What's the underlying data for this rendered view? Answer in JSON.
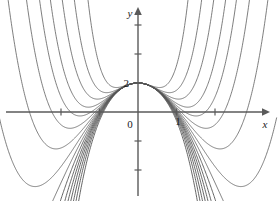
{
  "figure": {
    "title": "",
    "background_color": "#ffffff",
    "curve_color": "#555555",
    "axis_color": "#5a5a5a",
    "text_color": "#1a1a1a"
  },
  "axes": {
    "x_axis_label": "x",
    "y_axis_label": "y",
    "origin_label": "0",
    "x_tick_labels": [
      "1"
    ],
    "y_tick_labels": [
      "2"
    ],
    "x_axis_arrow": "arrow-right",
    "y_axis_arrow": "arrow-up"
  },
  "chart_data": {
    "type": "line",
    "title": "",
    "xlabel": "x",
    "ylabel": "y",
    "grid": false,
    "legend": "none",
    "xlim": [
      -3.4,
      3.4
    ],
    "ylim": [
      -4.6,
      4.4
    ],
    "xticks": [
      -2,
      -1,
      0,
      1,
      2
    ],
    "xtick_labels": [
      "",
      "",
      "0",
      "1",
      ""
    ],
    "yticks": [
      -3,
      -2,
      -1,
      0,
      1,
      2,
      3,
      4
    ],
    "ytick_labels": [
      "",
      "",
      "",
      "0",
      "",
      "2",
      "",
      ""
    ],
    "series": [
      {
        "name": "c=-1.0",
        "direction": "down",
        "steepness": 1.0
      },
      {
        "name": "c=-0.8",
        "direction": "down",
        "steepness": 0.8
      },
      {
        "name": "c=-0.6",
        "direction": "down",
        "steepness": 0.6
      },
      {
        "name": "c=-0.4",
        "direction": "down",
        "steepness": 0.4
      },
      {
        "name": "c=-0.2",
        "direction": "down",
        "steepness": 0.2
      },
      {
        "name": "c=0.0",
        "direction": "flat",
        "steepness": 0.0
      },
      {
        "name": "c=0.2",
        "direction": "up",
        "steepness": 0.2
      },
      {
        "name": "c=0.4",
        "direction": "up",
        "steepness": 0.4
      },
      {
        "name": "c=0.6",
        "direction": "up",
        "steepness": 0.6
      },
      {
        "name": "c=0.8",
        "direction": "up",
        "steepness": 0.8
      },
      {
        "name": "c=1.0",
        "direction": "up",
        "steepness": 1.0
      },
      {
        "name": "c=1.5",
        "direction": "up",
        "steepness": 1.5
      },
      {
        "name": "c=2.5",
        "direction": "up",
        "steepness": 2.5
      }
    ],
    "common_point": [
      0,
      1
    ]
  }
}
